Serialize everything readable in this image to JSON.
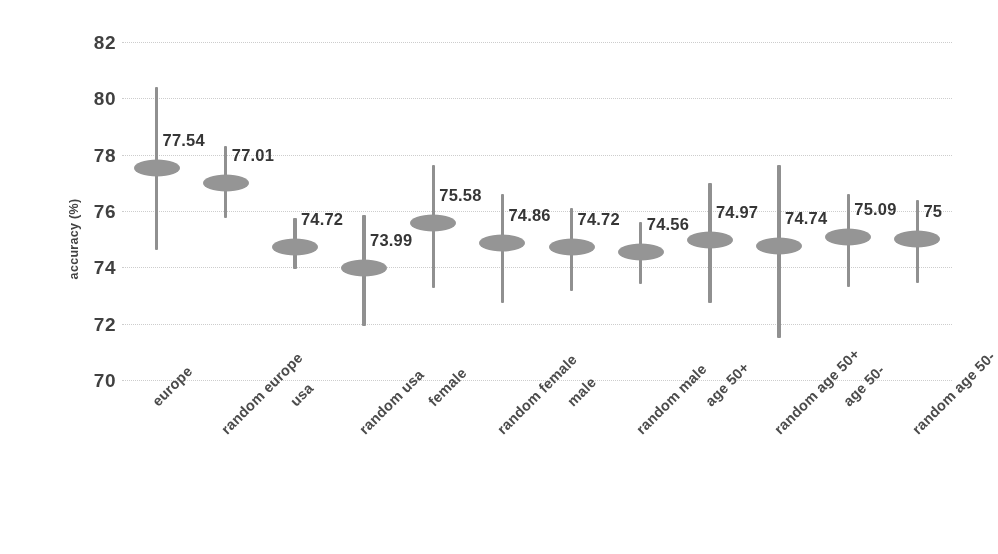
{
  "chart_data": {
    "type": "scatter",
    "title": "",
    "xlabel": "",
    "ylabel": "accuracy (%)",
    "ylim": [
      70,
      82
    ],
    "yticks": [
      82,
      80,
      78,
      76,
      74,
      72,
      70
    ],
    "grid": true,
    "legend": "none",
    "marker_color": "#939393",
    "errorbar_color": "#8e8e8e",
    "gridline_color": "#d6d6d6",
    "text_color": "#2f2f2f",
    "categories": [
      "europe",
      "random europe",
      "usa",
      "random usa",
      "female",
      "random female",
      "male",
      "random male",
      "age 50+",
      "random age 50+",
      "age 50-",
      "random age 50-"
    ],
    "values": [
      77.54,
      77.01,
      74.72,
      73.99,
      75.58,
      74.86,
      74.72,
      74.56,
      74.97,
      74.74,
      75.09,
      75
    ],
    "value_labels": [
      "77.54",
      "77.01",
      "74.72",
      "73.99",
      "75.58",
      "74.86",
      "74.72",
      "74.56",
      "74.97",
      "74.74",
      "75.09",
      "75"
    ],
    "error_low": [
      74.6,
      75.75,
      73.95,
      71.9,
      73.25,
      72.75,
      73.15,
      73.4,
      72.75,
      71.5,
      73.3,
      73.45
    ],
    "error_high": [
      80.4,
      78.3,
      75.75,
      75.85,
      77.65,
      76.6,
      76.1,
      75.6,
      77.0,
      77.65,
      76.6,
      76.4
    ]
  }
}
